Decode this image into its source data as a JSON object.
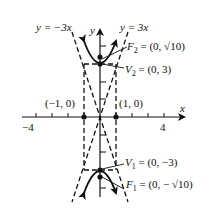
{
  "diagram": {
    "type": "hyperbola-graph",
    "colors": {
      "ink": "#111111",
      "background": "#ffffff"
    },
    "axes": {
      "x_label": "x",
      "y_label": "y",
      "x_tick_labels": {
        "neg": "−4",
        "pos": "4"
      }
    },
    "asymptotes": {
      "left": "y = −3x",
      "right": "y = 3x"
    },
    "points": {
      "f2": {
        "name": "F",
        "sub": "2",
        "value": " = (0, √10)"
      },
      "v2": {
        "name": "V",
        "sub": "2",
        "value": " = (0, 3)"
      },
      "v1": {
        "name": "V",
        "sub": "1",
        "value": " = (0, −3)"
      },
      "f1": {
        "name": "F",
        "sub": "1",
        "value": " = (0, − √10)"
      },
      "neg1": "(−1, 0)",
      "pos1": "(1, 0)"
    }
  }
}
